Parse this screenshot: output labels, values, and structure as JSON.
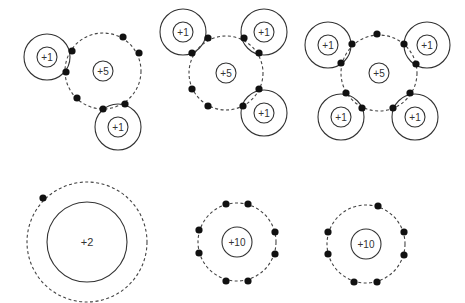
{
  "colors": {
    "line": "#333333",
    "dash": "#444444",
    "electron": "#111111",
    "background": "#ffffff"
  },
  "molecules": [
    {
      "name": "NH2-like",
      "center": {
        "label": "+5",
        "x": 103,
        "y": 71,
        "inner_r": 10,
        "shell_r": 38
      },
      "atoms": [
        {
          "label": "+1",
          "x": 47,
          "y": 57,
          "inner_r": 10,
          "shell_r": 23
        },
        {
          "label": "+1",
          "x": 118,
          "y": 127,
          "inner_r": 10,
          "shell_r": 23
        }
      ],
      "electrons": [
        [
          72,
          51
        ],
        [
          66,
          72
        ],
        [
          123,
          37
        ],
        [
          139,
          53
        ],
        [
          77,
          98
        ],
        [
          103,
          109
        ],
        [
          125,
          104
        ]
      ]
    },
    {
      "name": "NH3",
      "center": {
        "label": "+5",
        "x": 226,
        "y": 73,
        "inner_r": 10,
        "shell_r": 37
      },
      "atoms": [
        {
          "label": "+1",
          "x": 183,
          "y": 32,
          "inner_r": 10,
          "shell_r": 23
        },
        {
          "label": "+1",
          "x": 264,
          "y": 32,
          "inner_r": 10,
          "shell_r": 23
        },
        {
          "label": "+1",
          "x": 264,
          "y": 113,
          "inner_r": 10,
          "shell_r": 23
        }
      ],
      "electrons": [
        [
          208,
          38
        ],
        [
          192,
          53
        ],
        [
          244,
          38
        ],
        [
          259,
          53
        ],
        [
          192,
          89
        ],
        [
          208,
          106
        ],
        [
          259,
          89
        ],
        [
          243,
          106
        ]
      ]
    },
    {
      "name": "NH4",
      "center": {
        "label": "+5",
        "x": 379,
        "y": 73,
        "inner_r": 10,
        "shell_r": 38
      },
      "atoms": [
        {
          "label": "+1",
          "x": 328,
          "y": 45,
          "inner_r": 10,
          "shell_r": 23
        },
        {
          "label": "+1",
          "x": 427,
          "y": 45,
          "inner_r": 10,
          "shell_r": 23
        },
        {
          "label": "+1",
          "x": 341,
          "y": 117,
          "inner_r": 10,
          "shell_r": 23
        },
        {
          "label": "+1",
          "x": 415,
          "y": 117,
          "inner_r": 10,
          "shell_r": 23
        }
      ],
      "electrons": [
        [
          377,
          34
        ],
        [
          352,
          44
        ],
        [
          341,
          63
        ],
        [
          404,
          44
        ],
        [
          416,
          64
        ],
        [
          346,
          93
        ],
        [
          362,
          108
        ],
        [
          393,
          108
        ],
        [
          410,
          93
        ]
      ]
    }
  ],
  "ions": [
    {
      "name": "ion-plus-2",
      "label": "+2",
      "x": 87,
      "y": 242,
      "inner_r": 40,
      "shell_r": 60,
      "electrons": [
        [
          43,
          198
        ]
      ]
    },
    {
      "name": "ion-plus-10-a",
      "label": "+10",
      "x": 237,
      "y": 242,
      "inner_r": 15,
      "shell_r": 39,
      "electrons": [
        [
          226,
          204
        ],
        [
          248,
          204
        ],
        [
          199,
          230
        ],
        [
          199,
          253
        ],
        [
          275,
          232
        ],
        [
          275,
          254
        ],
        [
          226,
          281
        ],
        [
          248,
          281
        ]
      ]
    },
    {
      "name": "ion-plus-10-b",
      "label": "+10",
      "x": 366,
      "y": 244,
      "inner_r": 15,
      "shell_r": 39,
      "electrons": [
        [
          378,
          206
        ],
        [
          328,
          232
        ],
        [
          328,
          254
        ],
        [
          404,
          232
        ],
        [
          404,
          255
        ],
        [
          354,
          282
        ],
        [
          377,
          282
        ]
      ]
    }
  ]
}
